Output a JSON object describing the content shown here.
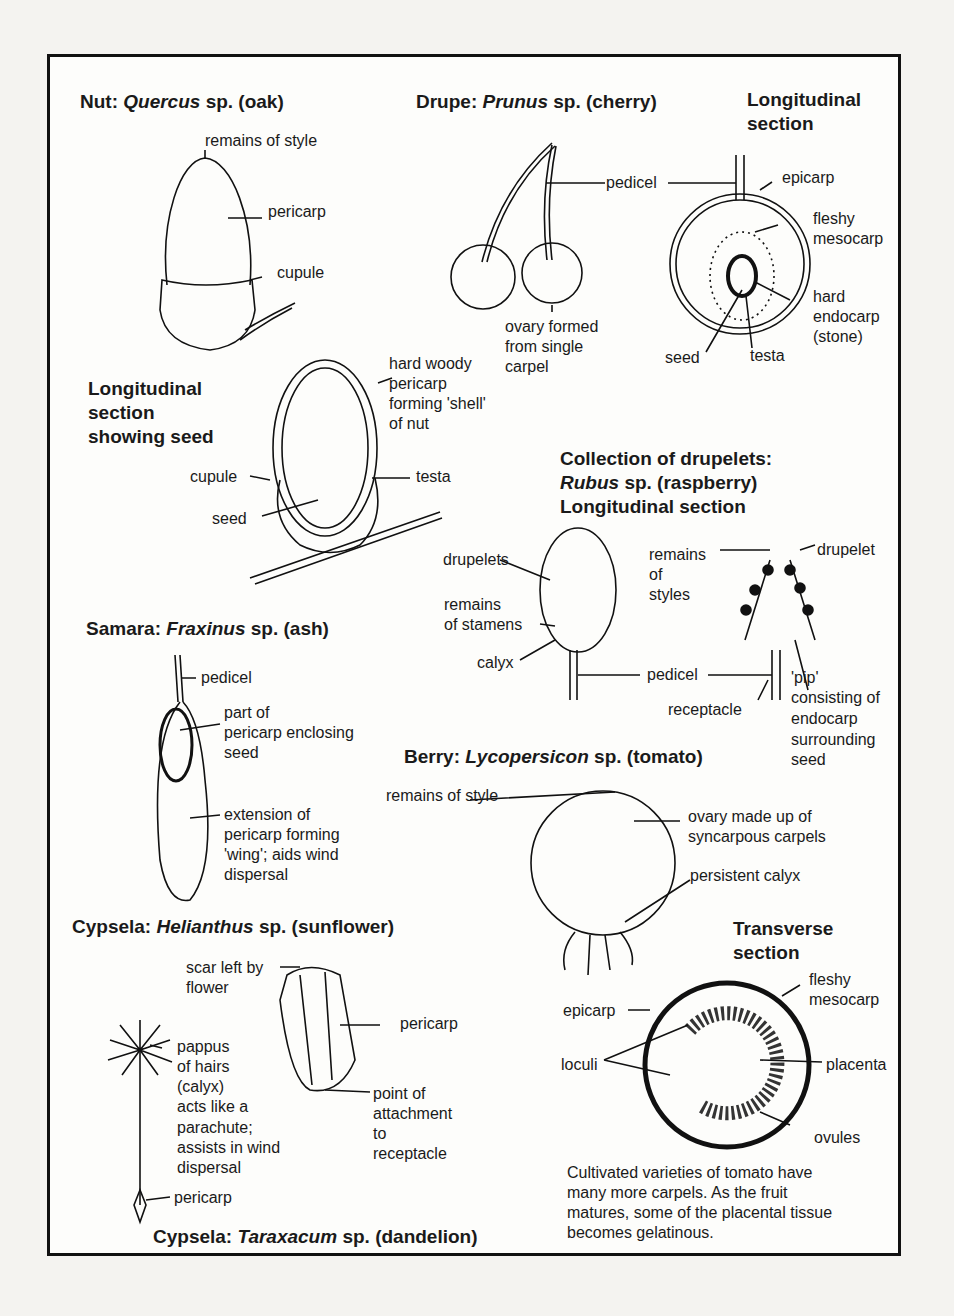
{
  "sections": {
    "nut": {
      "title_prefix": "Nut:",
      "genus": "Quercus",
      "title_suffix": "sp. (oak)",
      "labels": [
        "remains of style",
        "pericarp",
        "cupule"
      ],
      "ls_title": [
        "Longitudinal",
        "section",
        "showing seed"
      ],
      "ls_labels": {
        "pericarp": [
          "hard woody",
          "pericarp",
          "forming 'shell'",
          "of nut"
        ],
        "cupule": "cupule",
        "seed": "seed",
        "testa": "testa"
      }
    },
    "drupe": {
      "title_prefix": "Drupe:",
      "genus": "Prunus",
      "title_suffix": "sp. (cherry)",
      "pedicel": "pedicel",
      "ovary": [
        "ovary formed",
        "from single",
        "carpel"
      ],
      "ls_title": [
        "Longitudinal",
        "section"
      ],
      "ls_labels": {
        "epicarp": "epicarp",
        "mesocarp": [
          "fleshy",
          "mesocarp"
        ],
        "endocarp": [
          "hard",
          "endocarp",
          "(stone)"
        ],
        "seed": "seed",
        "testa": "testa"
      }
    },
    "raspberry": {
      "title": [
        "Collection of drupelets:",
        "sp. (raspberry)",
        "Longitudinal section"
      ],
      "genus": "Rubus",
      "labels": {
        "drupelets": "drupelets",
        "stamens": [
          "remains",
          "of stamens"
        ],
        "calyx": "calyx",
        "pedicel": "pedicel",
        "styles": [
          "remains",
          "of",
          "styles"
        ],
        "drupelet": "drupelet",
        "receptacle": "receptacle",
        "pip": [
          "'pip'",
          "consisting of",
          "endocarp",
          "surrounding",
          "seed"
        ]
      }
    },
    "samara": {
      "title_prefix": "Samara:",
      "genus": "Fraxinus",
      "title_suffix": "sp. (ash)",
      "labels": {
        "pedicel": "pedicel",
        "part": [
          "part of",
          "pericarp enclosing",
          "seed"
        ],
        "wing": [
          "extension of",
          "pericarp forming",
          "'wing'; aids wind",
          "dispersal"
        ]
      }
    },
    "berry": {
      "title_prefix": "Berry:",
      "genus": "Lycopersicon",
      "title_suffix": "sp. (tomato)",
      "labels": {
        "style": "remains of style",
        "ovary": [
          "ovary made up of",
          "syncarpous carpels"
        ],
        "calyx": "persistent calyx"
      },
      "ts_title": [
        "Transverse",
        "section"
      ],
      "ts_labels": {
        "mesocarp": [
          "fleshy",
          "mesocarp"
        ],
        "epicarp": "epicarp",
        "loculi": "loculi",
        "placenta": "placenta",
        "ovules": "ovules"
      },
      "note": [
        "Cultivated varieties of tomato have",
        "many more carpels. As the fruit",
        "matures, some of the placental tissue",
        "becomes gelatinous."
      ]
    },
    "sunflower": {
      "title_prefix": "Cypsela:",
      "genus": "Helianthus",
      "title_suffix": "sp. (sunflower)",
      "labels": {
        "scar": [
          "scar left by",
          "flower"
        ],
        "pericarp": "pericarp",
        "point": [
          "point of",
          "attachment",
          "to",
          "receptacle"
        ]
      }
    },
    "dandelion": {
      "title_prefix": "Cypsela:",
      "genus": "Taraxacum",
      "title_suffix": "sp. (dandelion)",
      "labels": {
        "pappus": [
          "pappus",
          "of hairs",
          "(calyx)",
          "acts like a",
          "parachute;",
          "assists in wind",
          "dispersal"
        ],
        "pericarp": "pericarp"
      }
    }
  }
}
